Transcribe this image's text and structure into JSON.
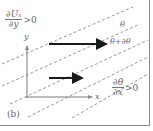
{
  "figure": {
    "panel_label": "(b)",
    "top_left_condition": {
      "numerator": "∂Uₓ",
      "denominator": "∂y",
      "relation": ">0"
    },
    "bottom_right_condition": {
      "numerator": "∂θ",
      "denominator": "∂x",
      "relation": ">0"
    },
    "isoline_labels": {
      "upper": "θ",
      "lower": "θ+∂θ"
    },
    "axes": {
      "x_label": "x",
      "y_label": "y"
    },
    "arrows": [
      {
        "name": "upper-velocity-arrow",
        "length": "long"
      },
      {
        "name": "lower-velocity-arrow",
        "length": "short"
      }
    ],
    "colors": {
      "axis": "#7a7a7a",
      "dash": "#8a8a8a",
      "arrow": "#1a1a1a",
      "text": "#666666",
      "frame": "#8a8a8a"
    }
  }
}
